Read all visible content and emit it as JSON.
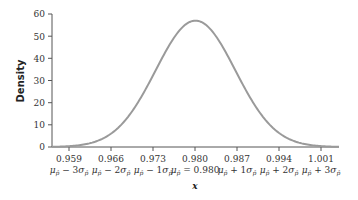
{
  "chart_data": {
    "type": "line",
    "title": "",
    "xlabel": "x",
    "ylabel": "Density",
    "ylim": [
      0,
      60
    ],
    "xlim": [
      0.9548,
      1.0052
    ],
    "yticks": [
      0,
      10,
      20,
      30,
      40,
      50,
      60
    ],
    "xticks": [
      0.959,
      0.966,
      0.973,
      0.98,
      0.987,
      0.994,
      1.001
    ],
    "xtick_labels": [
      "0.959",
      "0.966",
      "0.973",
      "0.980",
      "0.987",
      "0.994",
      "1.001"
    ],
    "xtick_sublabels": [
      "μp̂ − 3σp̂",
      "μp̂ − 2σp̂",
      "μp̂ − 1σp̂",
      "μp̂ = 0.980",
      "μp̂ + 1σp̂",
      "μp̂ + 2σp̂",
      "μp̂ + 3σp̂"
    ],
    "distribution": {
      "name": "normal",
      "mean": 0.98,
      "sd": 0.007,
      "peak_density": 57
    },
    "series": [
      {
        "name": "Normal density curve",
        "color": "#999999",
        "x": [
          0.955,
          0.959,
          0.962,
          0.966,
          0.969,
          0.973,
          0.976,
          0.98,
          0.984,
          0.987,
          0.991,
          0.994,
          0.998,
          1.001,
          1.005
        ],
        "values": [
          0.1,
          0.6,
          2.1,
          7.7,
          16.9,
          34.6,
          48.9,
          57.0,
          48.9,
          34.6,
          16.9,
          7.7,
          2.1,
          0.6,
          0.1
        ]
      }
    ],
    "grid": false,
    "legend": null
  },
  "labels": {
    "ylabel": "Density",
    "xlabel": "x",
    "yticks": [
      "0",
      "10",
      "20",
      "30",
      "40",
      "50",
      "60"
    ],
    "xticks": [
      "0.959",
      "0.966",
      "0.973",
      "0.980",
      "0.987",
      "0.994",
      "1.001"
    ],
    "sublabels": [
      {
        "pre": "μ",
        "sub": "p̂",
        "op": " − 3σ",
        "sub2": "p̂"
      },
      {
        "pre": "μ",
        "sub": "p̂",
        "op": " − 2σ",
        "sub2": "p̂"
      },
      {
        "pre": "μ",
        "sub": "p̂",
        "op": " − 1σ",
        "sub2": "p̂"
      },
      {
        "pre": "μ",
        "sub": "p̂",
        "op": " = 0.980",
        "sub2": ""
      },
      {
        "pre": "μ",
        "sub": "p̂",
        "op": " + 1σ",
        "sub2": "p̂"
      },
      {
        "pre": "μ",
        "sub": "p̂",
        "op": " + 2σ",
        "sub2": "p̂"
      },
      {
        "pre": "μ",
        "sub": "p̂",
        "op": " + 3σ",
        "sub2": "p̂"
      }
    ]
  },
  "colors": {
    "curve": "#9a9a9a",
    "axis": "#555555"
  }
}
